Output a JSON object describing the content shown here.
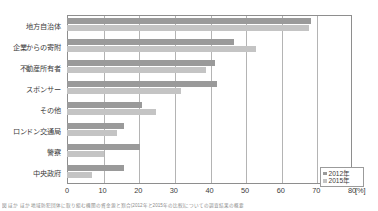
{
  "chart_data": {
    "type": "bar",
    "orientation": "horizontal",
    "title": "",
    "xlabel": "[%]",
    "ylabel": "",
    "xlim": [
      0,
      80
    ],
    "xticks": [
      0,
      10,
      20,
      30,
      40,
      50,
      60,
      70,
      80
    ],
    "x_unit": "80 [%]",
    "grid": true,
    "legend_position": "bottom-right",
    "categories": [
      "地方自治体",
      "企業からの寄附",
      "不動産所有者",
      "スポンサー",
      "その他",
      "ロンドン交通局",
      "警察",
      "中央政府"
    ],
    "series": [
      {
        "name": "2012年",
        "color": "#9a9a9a",
        "values": [
          68.5,
          47,
          41.5,
          42,
          21,
          16,
          20.5,
          16
        ]
      },
      {
        "name": "2015年",
        "color": "#c4c4c4",
        "values": [
          68,
          53,
          39,
          32,
          25,
          14,
          10.5,
          7
        ]
      }
    ]
  },
  "footnote": {
    "text": "図 ほか ほか 地域防犯団体に取り組む機関の資金源と割合(2012年と2015年の比較)についての調査結果の概要"
  },
  "colors": {
    "series_2012": "#9a9a9a",
    "series_2015": "#c4c4c4",
    "axis": "#8e8e8e",
    "grid": "#b4b4b4",
    "text": "#3c3c3c"
  }
}
